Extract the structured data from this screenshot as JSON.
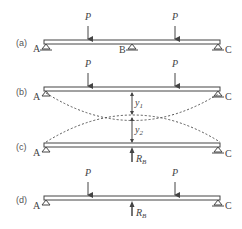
{
  "figure": {
    "panels": [
      {
        "id": "a",
        "label": "(a)",
        "supports": [
          "A",
          "B",
          "C"
        ],
        "loads": [
          "P",
          "P"
        ]
      },
      {
        "id": "b",
        "label": "(b)",
        "supports": [
          "A",
          "C"
        ],
        "loads": [
          "P",
          "P"
        ],
        "deflection": "y1"
      },
      {
        "id": "c",
        "label": "(c)",
        "supports": [
          "A",
          "C"
        ],
        "reaction": "R_B",
        "deflection": "y2"
      },
      {
        "id": "d",
        "label": "(d)",
        "supports": [
          "A",
          "C"
        ],
        "loads": [
          "P",
          "P"
        ],
        "reaction": "R_B"
      }
    ],
    "labels": {
      "a": "(a)",
      "b": "(b)",
      "c": "(c)",
      "d": "(d)",
      "A": "A",
      "B": "B",
      "C": "C",
      "P": "P",
      "y": "y",
      "sub1": "1",
      "sub2": "2",
      "R": "R",
      "subB": "B"
    }
  }
}
